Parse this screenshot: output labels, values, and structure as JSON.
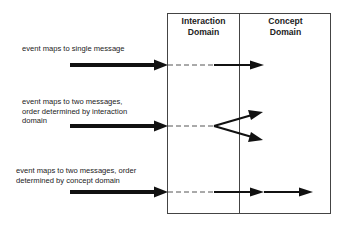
{
  "domains": [
    {
      "title_line1": "Interaction",
      "title_line2": "Domain"
    },
    {
      "title_line1": "Concept",
      "title_line2": "Domain"
    }
  ],
  "cases": [
    {
      "line1": "event maps to single message",
      "line2": "",
      "line3": ""
    },
    {
      "line1": "event maps to two messages,",
      "line2": "order determined by interaction",
      "line3": "domain"
    },
    {
      "line1": "event maps to two messages, order",
      "line2": "determined by concept domain",
      "line3": ""
    }
  ]
}
